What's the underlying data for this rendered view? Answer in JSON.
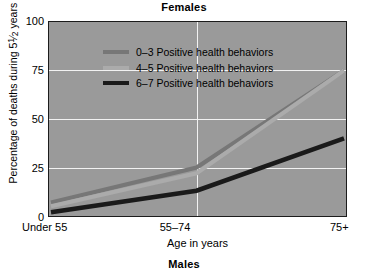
{
  "titles": {
    "top": "Females",
    "bottom": "Males"
  },
  "axes": {
    "ylabel": "Percentage of deaths during 5½ years",
    "xlabel": "Age in years",
    "yticks": [
      "0",
      "25",
      "50",
      "75",
      "100"
    ],
    "xticks": [
      "Under 55",
      "55–74",
      "75+"
    ]
  },
  "legend": {
    "items": [
      {
        "label": "0–3 Positive health behaviors",
        "color": "#777777"
      },
      {
        "label": "4–5 Positive health behaviors",
        "color": "#ababab"
      },
      {
        "label": "6–7 Positive health behaviors",
        "color": "#1a1a1a"
      }
    ]
  },
  "colors": {
    "plot_background": "#9a9a9a",
    "gridline": "#f2f2f2",
    "border": "#1c1c1c",
    "page_background": "#ffffff"
  },
  "chart_data": {
    "type": "line",
    "title": "Females",
    "subtitle": "Males",
    "xlabel": "Age in years",
    "ylabel": "Percentage of deaths during 5½ years",
    "categories": [
      "Under 55",
      "55–74",
      "75+"
    ],
    "ylim": [
      0,
      100
    ],
    "yticks": [
      0,
      25,
      50,
      75,
      100
    ],
    "grid": true,
    "legend_position": "top-left inside plot",
    "series": [
      {
        "name": "0–3 Positive health behaviors",
        "color": "#777777",
        "values": [
          7,
          25,
          75
        ]
      },
      {
        "name": "4–5 Positive health behaviors",
        "color": "#ababab",
        "values": [
          5,
          22,
          75
        ]
      },
      {
        "name": "6–7 Positive health behaviors",
        "color": "#1a1a1a",
        "values": [
          2,
          13,
          40
        ]
      }
    ]
  }
}
